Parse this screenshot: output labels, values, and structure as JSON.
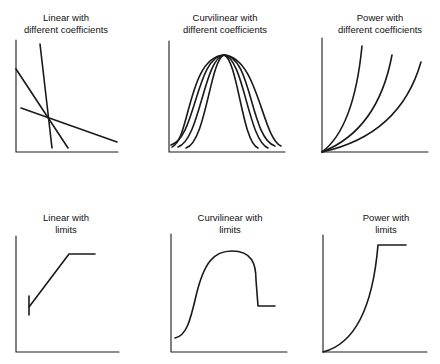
{
  "panels": [
    {
      "id": "linear-different",
      "title_line1": "Linear with",
      "title_line2": "different coefficients"
    },
    {
      "id": "curvilinear-different",
      "title_line1": "Curvilinear with",
      "title_line2": "different coefficients"
    },
    {
      "id": "power-different",
      "title_line1": "Power with",
      "title_line2": "different coefficients"
    },
    {
      "id": "linear-limits",
      "title_line1": "Linear with",
      "title_line2": "limits"
    },
    {
      "id": "curvilinear-limits",
      "title_line1": "Curvilinear with",
      "title_line2": "limits"
    },
    {
      "id": "power-limits",
      "title_line1": "Power with",
      "title_line2": "limits"
    }
  ],
  "colors": {
    "line": "#1a1a1a",
    "background": "#ffffff"
  }
}
